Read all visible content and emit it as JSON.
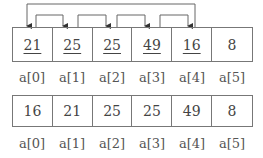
{
  "diagram": {
    "before": {
      "cells": [
        {
          "value": "21",
          "underlined": true
        },
        {
          "value": "25",
          "underlined": true
        },
        {
          "value": "25",
          "underlined": true
        },
        {
          "value": "49",
          "underlined": true
        },
        {
          "value": "16",
          "underlined": true
        },
        {
          "value": "8",
          "underlined": false
        }
      ],
      "labels": [
        "a[0]",
        "a[1]",
        "a[2]",
        "a[3]",
        "a[4]",
        "a[5]"
      ]
    },
    "after": {
      "cells": [
        {
          "value": "16"
        },
        {
          "value": "21"
        },
        {
          "value": "25"
        },
        {
          "value": "25"
        },
        {
          "value": "49"
        },
        {
          "value": "8"
        }
      ],
      "labels": [
        "a[0]",
        "a[1]",
        "a[2]",
        "a[3]",
        "a[4]",
        "a[5]"
      ]
    },
    "arrows": [
      {
        "from": "a[4]",
        "to": "a[0]"
      },
      {
        "from": "a[0]",
        "to": "a[1]"
      },
      {
        "from": "a[1]",
        "to": "a[2]"
      },
      {
        "from": "a[2]",
        "to": "a[3]"
      },
      {
        "from": "a[3]",
        "to": "a[4]"
      }
    ],
    "colors": {
      "line": "#555555",
      "text": "#444444"
    }
  }
}
